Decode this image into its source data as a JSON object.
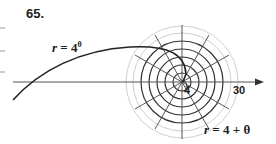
{
  "problem_number": "65.",
  "labels": {
    "exp_curve": {
      "var": "r",
      "eq": " = 4",
      "sup": "θ"
    },
    "spiral": {
      "var": "r",
      "eq": " = 4 + θ"
    }
  },
  "ticks": {
    "inner": "4",
    "outer": "30"
  },
  "colors": {
    "curve": "#222222",
    "grid_dark": "#333333",
    "grid_light": "#cccccc"
  }
}
